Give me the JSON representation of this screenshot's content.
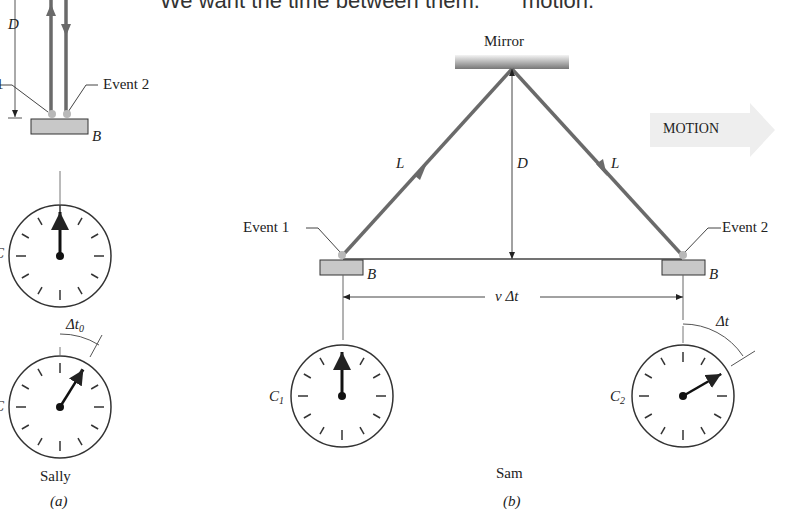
{
  "caption": {
    "line_left": "We want the time between them.",
    "line_right": "motion."
  },
  "panel_a": {
    "distance_label": "D",
    "event1_label": "Event 1",
    "event2_label": "Event 2",
    "block_label": "B",
    "clock_top_label": "C",
    "clock_bottom_label": "C",
    "interval_label": "Δt",
    "interval_sub": "0",
    "observer": "Sally",
    "panel_tag": "(a)",
    "clock_top_hand_deg": 0,
    "clock_bottom_hand_deg": 32
  },
  "panel_b": {
    "mirror_label": "Mirror",
    "path_left_label": "L",
    "path_right_label": "L",
    "distance_label": "D",
    "motion_label": "MOTION",
    "event1_label": "Event 1",
    "event2_label": "Event 2",
    "block_left_label": "B",
    "block_right_label": "B",
    "displacement_label": "v Δt",
    "clock1_label": "C",
    "clock1_sub": "1",
    "clock2_label": "C",
    "clock2_sub": "2",
    "interval_label": "Δt",
    "observer": "Sam",
    "panel_tag": "(b)",
    "clock1_hand_deg": 0,
    "clock2_hand_deg": 60
  },
  "colors": {
    "light_path": "#6a6a6a",
    "block_fill": "#c8c8c8",
    "event_dot": "#b8b8b8",
    "motion_arrow": "#eeeeee",
    "ink": "#222222"
  }
}
